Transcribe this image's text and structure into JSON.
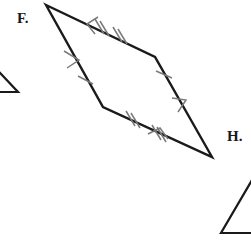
{
  "page": {
    "width": 251,
    "height": 243,
    "background_color": "#ffffff",
    "stroke_color": "#1a1a1a",
    "tick_color": "#6b6b6b"
  },
  "labels": {
    "f": "F.",
    "h": "H."
  },
  "figures": {
    "parallelogram_f": {
      "name": "parallelogram-f",
      "shape": "quadrilateral",
      "vertices": [
        {
          "name": "top",
          "x": 46,
          "y": 5
        },
        {
          "name": "right-upper",
          "x": 155,
          "y": 57
        },
        {
          "name": "bottom-right",
          "x": 212,
          "y": 157
        },
        {
          "name": "left-lower",
          "x": 103,
          "y": 107
        }
      ],
      "sides": [
        {
          "name": "top-side",
          "from": "top",
          "to": "right-upper",
          "ticks": 2,
          "arrows": 1
        },
        {
          "name": "right-side",
          "from": "right-upper",
          "to": "bottom-right",
          "ticks": 1,
          "arrows": 1
        },
        {
          "name": "bottom-side",
          "from": "bottom-right",
          "to": "left-lower",
          "ticks": 2,
          "arrows": 1
        },
        {
          "name": "left-side",
          "from": "left-lower",
          "to": "top",
          "ticks": 1,
          "arrows": 1
        }
      ]
    },
    "triangle_left_partial": {
      "name": "triangle-left-partial",
      "shape": "triangle-fragment",
      "points": [
        {
          "x": -14,
          "y": 58
        },
        {
          "x": 18,
          "y": 92
        },
        {
          "x": -14,
          "y": 92
        }
      ]
    },
    "triangle_h_partial": {
      "name": "triangle-h-partial",
      "shape": "triangle-fragment",
      "points": [
        {
          "x": 262,
          "y": 163
        },
        {
          "x": 221,
          "y": 233
        },
        {
          "x": 262,
          "y": 233
        }
      ]
    }
  }
}
